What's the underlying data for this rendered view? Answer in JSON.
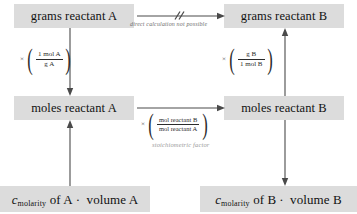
{
  "diagram": {
    "box_fill_color": "#dcdcdc",
    "arrow_color": "#4a4a4a",
    "annotation_color": "#6e6e6e",
    "stoich_label_color": "#9a9a9a"
  },
  "nodes": {
    "grams_a": "grams reactant A",
    "grams_b": "grams reactant B",
    "moles_a": "moles reactant A",
    "moles_b": "moles reactant B",
    "conc_a": {
      "symbol": "c",
      "subscript": "molarity",
      "rest": "of A",
      "operator": "·",
      "factor": "volume A"
    },
    "conc_b": {
      "symbol": "c",
      "subscript": "molarity",
      "rest": "of B",
      "operator": "·",
      "factor": "volume B"
    }
  },
  "annotations": {
    "direct": "direct calculation not possible",
    "stoichiometric": "stoichiometric factor"
  },
  "factors": {
    "left": {
      "times": "×",
      "numerator": "1 mol A",
      "denominator": "g A"
    },
    "right": {
      "times": "×",
      "numerator": "g B",
      "denominator": "1 mol B"
    },
    "center": {
      "times": "×",
      "numerator": "mol reactant B",
      "denominator": "mol reactant A"
    }
  }
}
